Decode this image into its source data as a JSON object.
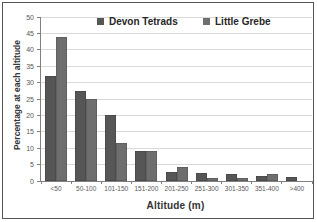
{
  "chart_data": {
    "type": "bar",
    "title": "",
    "categories": [
      "<50",
      "50-100",
      "101-150",
      "151-200",
      "201-250",
      "251-300",
      "301-350",
      "351-400",
      ">400"
    ],
    "series": [
      {
        "name": "Devon Tetrads",
        "color": "#565656",
        "values": [
          32,
          27.5,
          20,
          9,
          2.7,
          2.5,
          2,
          1.4,
          1.3
        ]
      },
      {
        "name": "Little Grebe",
        "color": "#6e6e6e",
        "values": [
          44,
          25,
          11.7,
          9.3,
          4.4,
          1,
          0.8,
          2,
          0
        ]
      }
    ],
    "xlabel": "Altitude (m)",
    "ylabel": "Percentage at each altitude",
    "ylim": [
      0,
      50
    ],
    "yticks": [
      0,
      5,
      10,
      15,
      20,
      25,
      30,
      35,
      40,
      45,
      50
    ],
    "grid": "horizontal",
    "legend_position": "top-inside"
  },
  "colors": {
    "background": "#ffffff",
    "frame_border": "#555555",
    "axis": "#808080",
    "gridline": "#d9d9d9",
    "tick_text": "#595959",
    "label_text": "#333333"
  }
}
